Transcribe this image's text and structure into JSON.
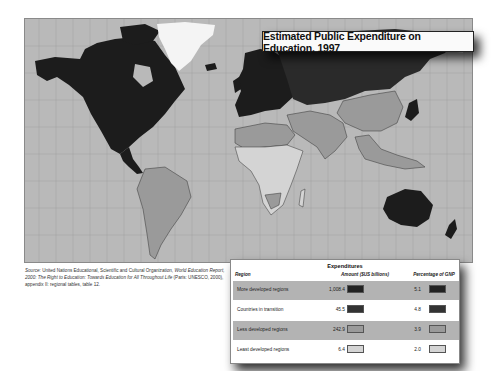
{
  "map": {
    "title": "Estimated Public Expenditure on Education, 1997",
    "background_color": "#b9b9b9",
    "grid_color": "#a5a5a5",
    "category_colors": {
      "more_developed": "#1c1c1c",
      "countries_in_transition": "#2e2e2e",
      "less_developed": "#9a9a9a",
      "least_developed": "#d4d4d4",
      "no_data": "#f4f4f4"
    }
  },
  "source": {
    "label": "Source:",
    "text_part1": "United Nations Educational, Scientific and Cultural Organization,",
    "italic_title": "World Education Report, 2000: The Right to Education: Towards Education for All Throughout Life",
    "text_part2": "(Paris: UNESCO, 2000), appendix II: regional tables, table 12."
  },
  "table": {
    "group_header": "Expenditures",
    "columns": {
      "region": "Region",
      "amount": "Amount ($US billions)",
      "percentage": "Percentage of GNP"
    },
    "rows": [
      {
        "region": "More developed regions",
        "amount": "1,008.4",
        "percentage": "5.1",
        "color": "#222222",
        "shaded": true
      },
      {
        "region": "Countries in transition",
        "amount": "45.5",
        "percentage": "4.8",
        "color": "#333333",
        "shaded": false
      },
      {
        "region": "Less developed regions",
        "amount": "242.9",
        "percentage": "3.9",
        "color": "#9a9a9a",
        "shaded": true
      },
      {
        "region": "Least developed regions",
        "amount": "6.4",
        "percentage": "2.0",
        "color": "#d4d4d4",
        "shaded": false
      }
    ]
  }
}
